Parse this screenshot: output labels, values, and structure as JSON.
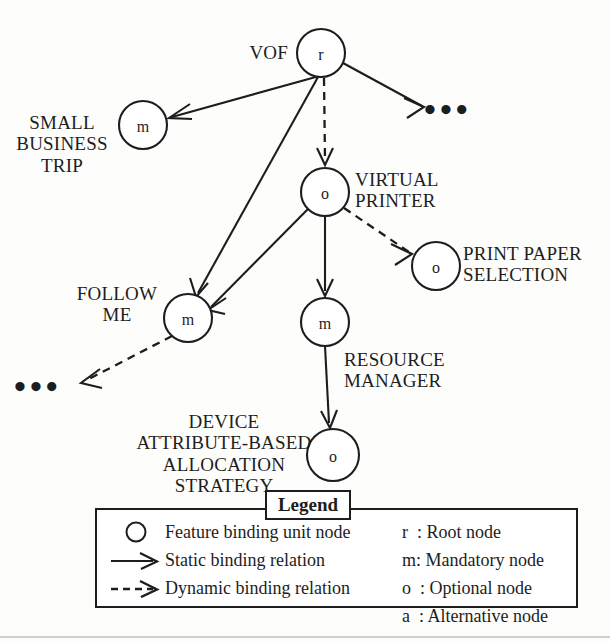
{
  "diagram": {
    "nodes": [
      {
        "id": "root",
        "letter": "r",
        "label": "VOF",
        "cx": 321,
        "cy": 53,
        "r": 24
      },
      {
        "id": "sbt",
        "letter": "m",
        "label": "SMALL\nBUSINESS\nTRIP",
        "cx": 143,
        "cy": 125,
        "r": 24
      },
      {
        "id": "vprinter",
        "letter": "o",
        "label": "VIRTUAL\nPRINTER",
        "cx": 325,
        "cy": 192,
        "r": 24
      },
      {
        "id": "paper",
        "letter": "o",
        "label": "PRINT PAPER\nSELECTION",
        "cx": 436,
        "cy": 266,
        "r": 24
      },
      {
        "id": "followme",
        "letter": "m",
        "label": "FOLLOW\nME",
        "cx": 188,
        "cy": 318,
        "r": 24
      },
      {
        "id": "resmgr",
        "letter": "m",
        "label": "RESOURCE\nMANAGER",
        "cx": 325,
        "cy": 322,
        "r": 24
      },
      {
        "id": "devattr",
        "letter": "o",
        "label": "DEVICE\nATTRIBUTE-BASED\nALLOCATION\nSTRATEGY",
        "cx": 333,
        "cy": 455,
        "r": 26
      }
    ],
    "ellipses": [
      {
        "id": "ellipsis-top-right",
        "text": "•••"
      },
      {
        "id": "ellipsis-bottom-left",
        "text": "•••"
      }
    ],
    "edges": [
      {
        "from": "root",
        "to": "sbt",
        "kind": "static"
      },
      {
        "from": "root",
        "to": "vprinter",
        "kind": "dynamic"
      },
      {
        "from": "root",
        "to": "followme",
        "kind": "static"
      },
      {
        "from": "root",
        "to": "ellipsis-top-right",
        "kind": "static"
      },
      {
        "from": "vprinter",
        "to": "paper",
        "kind": "dynamic"
      },
      {
        "from": "vprinter",
        "to": "followme",
        "kind": "static"
      },
      {
        "from": "vprinter",
        "to": "resmgr",
        "kind": "static"
      },
      {
        "from": "resmgr",
        "to": "devattr",
        "kind": "static"
      },
      {
        "from": "followme",
        "to": "ellipsis-bottom-left",
        "kind": "dynamic"
      }
    ]
  },
  "labels": {
    "vof": "VOF",
    "small_business_trip": "SMALL\nBUSINESS\nTRIP",
    "virtual_printer": "VIRTUAL\nPRINTER",
    "print_paper_selection": "PRINT PAPER\nSELECTION",
    "follow_me": "FOLLOW\nME",
    "resource_manager": "RESOURCE\nMANAGER",
    "device_attribute": "DEVICE\nATTRIBUTE-BASED\nALLOCATION\nSTRATEGY",
    "ellipsis": "•••"
  },
  "legend": {
    "title": "Legend",
    "symbols": [
      {
        "symbol": "circle",
        "text": "Feature binding unit node"
      },
      {
        "symbol": "solid-arrow",
        "text": "Static binding relation"
      },
      {
        "symbol": "dashed-arrow",
        "text": "Dynamic binding relation"
      }
    ],
    "keys": [
      "r  : Root node",
      "m: Mandatory node",
      "o  : Optional node",
      "a  : Alternative node"
    ]
  },
  "colors": {
    "ink": "#1d1d1d",
    "paper": "#fdfdfc",
    "node_fill": "#ffffff"
  }
}
